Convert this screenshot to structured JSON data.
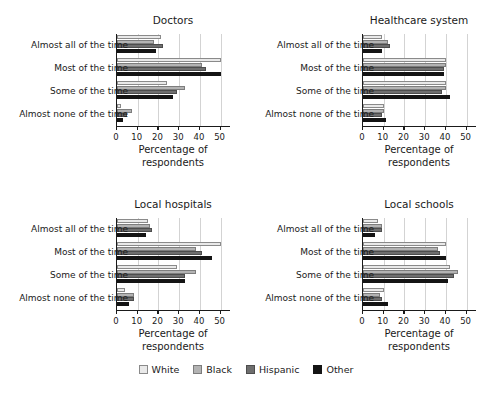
{
  "chart_data": {
    "type": "bar",
    "orientation": "horizontal",
    "title": "",
    "xlabel": "Percentage of respondents",
    "ylabel": "",
    "xlim": [
      0,
      55
    ],
    "xticks": [
      0,
      10,
      20,
      30,
      40,
      50
    ],
    "grid": true,
    "legend_position": "bottom",
    "categories": [
      "Almost all of the time",
      "Most of the time",
      "Some of the time",
      "Almost none of the time"
    ],
    "legend": [
      "White",
      "Black",
      "Hispanic",
      "Other"
    ],
    "panels": [
      {
        "title": "Doctors",
        "series": [
          {
            "name": "White",
            "values": [
              21,
              50,
              24,
              2
            ]
          },
          {
            "name": "Black",
            "values": [
              18,
              41,
              33,
              7
            ]
          },
          {
            "name": "Hispanic",
            "values": [
              22,
              43,
              29,
              5
            ]
          },
          {
            "name": "Other",
            "values": [
              19,
              50,
              27,
              3
            ]
          }
        ]
      },
      {
        "title": "Healthcare system",
        "series": [
          {
            "name": "White",
            "values": [
              9,
              40,
              40,
              10
            ]
          },
          {
            "name": "Black",
            "values": [
              12,
              40,
              40,
              10
            ]
          },
          {
            "name": "Hispanic",
            "values": [
              13,
              39,
              38,
              9
            ]
          },
          {
            "name": "Other",
            "values": [
              9,
              39,
              42,
              11
            ]
          }
        ]
      },
      {
        "title": "Local hospitals",
        "series": [
          {
            "name": "White",
            "values": [
              15,
              50,
              29,
              4
            ]
          },
          {
            "name": "Black",
            "values": [
              16,
              38,
              38,
              8
            ]
          },
          {
            "name": "Hispanic",
            "values": [
              17,
              41,
              33,
              8
            ]
          },
          {
            "name": "Other",
            "values": [
              14,
              46,
              33,
              6
            ]
          }
        ]
      },
      {
        "title": "Local schools",
        "series": [
          {
            "name": "White",
            "values": [
              7,
              40,
              42,
              10
            ]
          },
          {
            "name": "Black",
            "values": [
              9,
              36,
              46,
              8
            ]
          },
          {
            "name": "Hispanic",
            "values": [
              9,
              37,
              44,
              9
            ]
          },
          {
            "name": "Other",
            "values": [
              6,
              40,
              41,
              12
            ]
          }
        ]
      }
    ]
  },
  "axis": {
    "tick_labels": [
      "0",
      "10",
      "20",
      "30",
      "40",
      "50"
    ],
    "title_line1": "Percentage of",
    "title_line2": "respondents"
  },
  "legend": {
    "items": [
      {
        "label": "White",
        "color": "#e9e9e9"
      },
      {
        "label": "Black",
        "color": "#b3b3b3"
      },
      {
        "label": "Hispanic",
        "color": "#6e6e6e"
      },
      {
        "label": "Other",
        "color": "#141414"
      }
    ]
  }
}
